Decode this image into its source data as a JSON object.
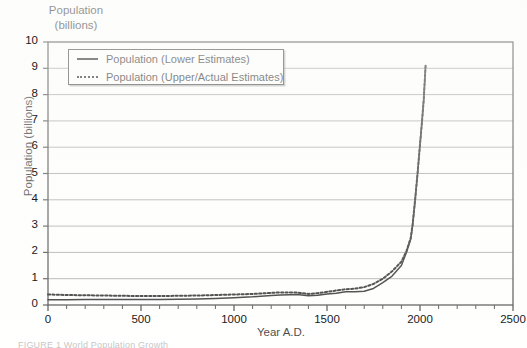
{
  "figure": {
    "corner_title": "Population\n(billions)",
    "caption_partial": "FIGURE 1   World Population Growth"
  },
  "legend": {
    "position": "top-left-inside",
    "entries": [
      {
        "label": "Population (Lower Estimates)",
        "style": "solid",
        "key_icon": "solid-line-icon"
      },
      {
        "label": "Population (Upper/Actual Estimates)",
        "style": "dotted",
        "key_icon": "dotted-line-icon"
      }
    ]
  },
  "chart_data": {
    "type": "line",
    "title": "Population (billions)",
    "xlabel": "Year A.D.",
    "ylabel": "Population (billions)",
    "xlim": [
      0,
      2500
    ],
    "ylim": [
      0,
      10
    ],
    "xticks": [
      0,
      500,
      1000,
      1500,
      2000,
      2500
    ],
    "yticks": [
      0,
      1,
      2,
      3,
      4,
      5,
      6,
      7,
      8,
      9,
      10
    ],
    "xtick_labels": [
      "0",
      "500",
      "1000",
      "1500",
      "2000",
      "2500"
    ],
    "ytick_labels": [
      "0",
      "1",
      "2",
      "3",
      "4",
      "5",
      "6",
      "7",
      "8",
      "9",
      "10"
    ],
    "grid": "horizontal",
    "minor_xticks_interval": 100,
    "legend_position": "upper left",
    "series": [
      {
        "name": "Population (Lower Estimates)",
        "style": "solid",
        "color": "#1a1a1a",
        "x": [
          0,
          100,
          200,
          300,
          400,
          500,
          600,
          700,
          800,
          900,
          1000,
          1100,
          1200,
          1250,
          1300,
          1340,
          1400,
          1450,
          1500,
          1550,
          1600,
          1650,
          1700,
          1750,
          1800,
          1850,
          1900,
          1927,
          1950,
          1960,
          1974,
          1987,
          1999,
          2011,
          2020,
          2030
        ],
        "values": [
          0.2,
          0.2,
          0.21,
          0.21,
          0.21,
          0.21,
          0.21,
          0.22,
          0.23,
          0.25,
          0.28,
          0.31,
          0.36,
          0.38,
          0.39,
          0.4,
          0.35,
          0.37,
          0.42,
          0.45,
          0.5,
          0.5,
          0.52,
          0.63,
          0.85,
          1.1,
          1.5,
          2.0,
          2.5,
          3.0,
          4.0,
          5.0,
          6.0,
          7.0,
          7.8,
          9.1
        ]
      },
      {
        "name": "Population (Upper/Actual Estimates)",
        "style": "dotted",
        "color": "#1a1a1a",
        "x": [
          0,
          100,
          200,
          300,
          400,
          500,
          600,
          700,
          800,
          900,
          1000,
          1100,
          1200,
          1250,
          1300,
          1340,
          1400,
          1450,
          1500,
          1550,
          1600,
          1650,
          1700,
          1750,
          1800,
          1850,
          1900,
          1927,
          1950,
          1960,
          1974,
          1987,
          1999,
          2011,
          2020,
          2030
        ],
        "values": [
          0.4,
          0.38,
          0.37,
          0.36,
          0.35,
          0.34,
          0.34,
          0.35,
          0.36,
          0.38,
          0.4,
          0.42,
          0.46,
          0.48,
          0.48,
          0.47,
          0.42,
          0.45,
          0.5,
          0.55,
          0.6,
          0.62,
          0.68,
          0.8,
          1.0,
          1.28,
          1.65,
          2.05,
          2.55,
          3.05,
          4.02,
          5.02,
          6.02,
          7.0,
          7.8,
          9.1
        ]
      }
    ]
  }
}
